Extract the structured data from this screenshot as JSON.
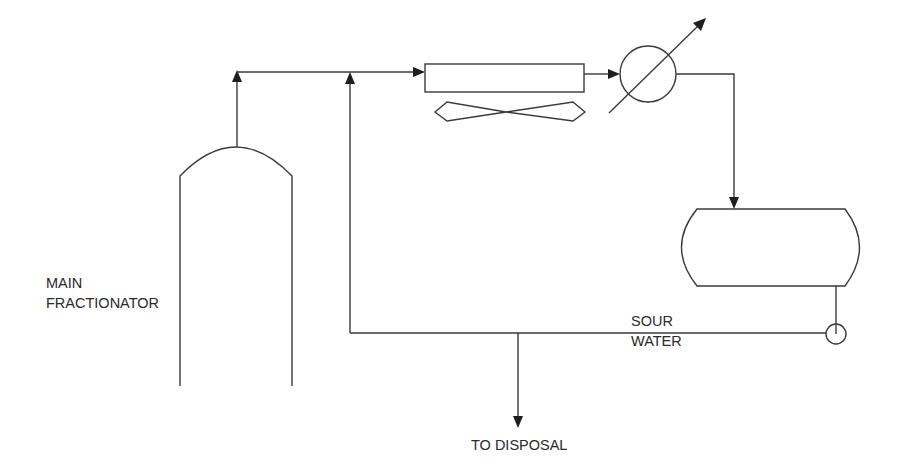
{
  "diagram": {
    "type": "process-flow-diagram",
    "colors": {
      "line": "#3a3a3a",
      "arrow": "#1e1e1e",
      "text": "#2a2a2a",
      "background": "#ffffff"
    },
    "labels": {
      "column_line1": "MAIN",
      "column_line2": "FRACTIONATOR",
      "sour_line1": "SOUR",
      "sour_line2": "WATER",
      "disposal": "TO DISPOSAL"
    },
    "equipment": [
      {
        "id": "main-fractionator",
        "symbol": "column-vessel"
      },
      {
        "id": "air-cooler",
        "symbol": "air-cooled-exchanger-with-fan"
      },
      {
        "id": "trim-cooler",
        "symbol": "heat-exchanger-adjustable"
      },
      {
        "id": "overhead-drum",
        "symbol": "horizontal-drum"
      },
      {
        "id": "sour-water-pump",
        "symbol": "pump"
      }
    ],
    "streams": [
      {
        "from": "main-fractionator",
        "to": "air-cooler"
      },
      {
        "from": "sour-water-return",
        "to": "air-cooler",
        "note": "injection upstream of air cooler"
      },
      {
        "from": "air-cooler",
        "to": "trim-cooler"
      },
      {
        "from": "trim-cooler",
        "to": "overhead-drum"
      },
      {
        "from": "overhead-drum",
        "to": "sour-water-pump"
      },
      {
        "from": "sour-water-pump",
        "to": "disposal"
      }
    ]
  }
}
